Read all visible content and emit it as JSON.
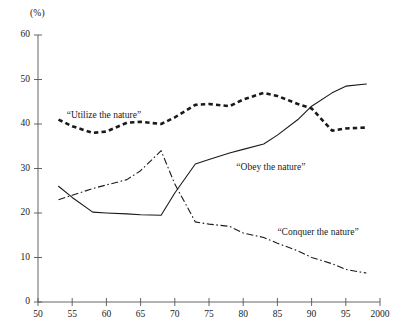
{
  "chart_data": {
    "type": "line",
    "title": "",
    "subtitle": "",
    "xlabel": "",
    "ylabel": "",
    "unit_label": "(%)",
    "xlim": [
      1950,
      2000
    ],
    "ylim": [
      0,
      60
    ],
    "grid": false,
    "legend_position": "inline-annotations",
    "x_tick_labels": [
      "50",
      "55",
      "60",
      "65",
      "70",
      "75",
      "80",
      "85",
      "90",
      "95",
      "2000"
    ],
    "x_tick_values": [
      1950,
      1955,
      1960,
      1965,
      1970,
      1975,
      1980,
      1985,
      1990,
      1995,
      2000
    ],
    "y_tick_labels": [
      "0",
      "10",
      "20",
      "30",
      "40",
      "50",
      "60"
    ],
    "y_tick_values": [
      0,
      10,
      20,
      30,
      40,
      50,
      60
    ],
    "series": [
      {
        "name": "“Utilize the nature”",
        "style": "dotted",
        "color": "#1a1a1a",
        "label_x": 1954.2,
        "label_y": 41.6,
        "x": [
          1953,
          1955,
          1958,
          1960,
          1963,
          1965,
          1968,
          1970,
          1973,
          1975,
          1978,
          1980,
          1983,
          1985,
          1988,
          1990,
          1993,
          1995,
          1998
        ],
        "values": [
          41.0,
          39.5,
          38.0,
          38.3,
          40.3,
          40.5,
          40.0,
          41.5,
          44.3,
          44.5,
          44.0,
          45.5,
          47.0,
          46.3,
          44.5,
          43.5,
          38.5,
          39.0,
          39.2
        ]
      },
      {
        "name": "“Obey the nature”",
        "style": "solid",
        "color": "#1a1a1a",
        "label_x": 1979.0,
        "label_y": 30.0,
        "x": [
          1953,
          1955,
          1958,
          1960,
          1963,
          1965,
          1968,
          1970,
          1973,
          1975,
          1978,
          1980,
          1983,
          1985,
          1988,
          1990,
          1993,
          1995,
          1998
        ],
        "values": [
          26.0,
          23.5,
          20.2,
          20.0,
          19.8,
          19.6,
          19.5,
          24.5,
          31.0,
          32.0,
          33.5,
          34.3,
          35.5,
          37.5,
          41.0,
          44.0,
          47.0,
          48.5,
          49.0
        ]
      },
      {
        "name": "“Conquer the nature”",
        "style": "dash-dot",
        "color": "#1a1a1a",
        "label_x": 1985.0,
        "label_y": 15.2,
        "x": [
          1953,
          1955,
          1958,
          1960,
          1963,
          1965,
          1968,
          1970,
          1973,
          1975,
          1978,
          1980,
          1983,
          1985,
          1988,
          1990,
          1993,
          1995,
          1998
        ],
        "values": [
          23.0,
          24.0,
          25.5,
          26.3,
          27.5,
          29.5,
          34.0,
          26.5,
          18.0,
          17.5,
          17.0,
          15.5,
          14.5,
          13.2,
          11.5,
          10.0,
          8.6,
          7.3,
          6.5
        ]
      }
    ]
  }
}
